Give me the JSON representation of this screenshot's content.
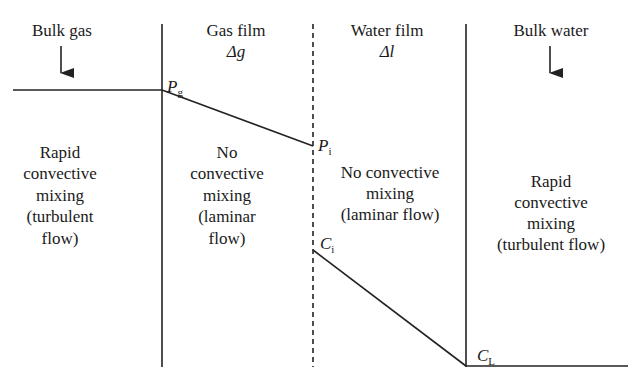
{
  "regions": [
    {
      "id": "bulk-gas",
      "title": "Bulk gas",
      "subtitle": "",
      "description": [
        "Rapid",
        "convective",
        "mixing",
        "(turbulent",
        "flow)"
      ]
    },
    {
      "id": "gas-film",
      "title": "Gas film",
      "subtitle": "Δg",
      "description": [
        "No",
        "convective",
        "mixing",
        "(laminar",
        "flow)"
      ]
    },
    {
      "id": "water-film",
      "title": "Water film",
      "subtitle": "Δl",
      "description": [
        "No convective",
        "mixing",
        "(laminar flow)"
      ]
    },
    {
      "id": "bulk-water",
      "title": "Bulk water",
      "subtitle": "",
      "description": [
        "Rapid",
        "convective",
        "mixing",
        "(turbulent flow)"
      ]
    }
  ],
  "points": {
    "Pg": {
      "main": "P",
      "sub": "g"
    },
    "Pi": {
      "main": "P",
      "sub": "i"
    },
    "Ci": {
      "main": "C",
      "sub": "i"
    },
    "CL": {
      "main": "C",
      "sub": "L"
    }
  },
  "colors": {
    "line": "#222222",
    "text": "#1a1a1a",
    "background": "#ffffff"
  }
}
